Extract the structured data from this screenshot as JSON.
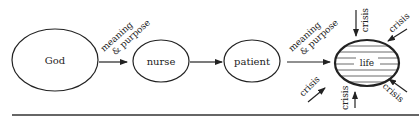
{
  "diagram": {
    "nodes": {
      "god": "God",
      "nurse": "nurse",
      "patient": "patient",
      "life": "life"
    },
    "edges": {
      "god_to_nurse_line1": "meaning",
      "god_to_nurse_line2": "& purpose",
      "patient_to_life_line1": "meaning",
      "patient_to_life_line2": "& purpose"
    },
    "crisis_label": "crisis",
    "crisis": [
      "crisis",
      "crisis",
      "crisis",
      "crisis",
      "crisis"
    ],
    "colors": {
      "ink": "#222222",
      "background": "#ffffff"
    }
  }
}
